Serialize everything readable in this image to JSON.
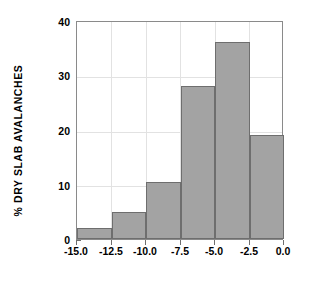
{
  "chart_data": {
    "type": "bar",
    "title": "",
    "subtitle": "",
    "xlabel": "",
    "ylabel": "% DRY SLAB AVALANCHES",
    "categories": [
      "-15.0 to -12.5",
      "-12.5 to -10.0",
      "-10.0 to -7.5",
      "-7.5 to -5.0",
      "-5.0 to -2.5",
      "-2.5 to 0.0"
    ],
    "bin_edges": [
      -15.0,
      -12.5,
      -10.0,
      -7.5,
      -5.0,
      -2.5,
      0.0
    ],
    "values": [
      2,
      5,
      10.5,
      28,
      36,
      19
    ],
    "xlim": [
      -15.0,
      0.0
    ],
    "ylim": [
      0,
      40
    ],
    "xticks": [
      -15.0,
      -12.5,
      -10.0,
      -7.5,
      -5.0,
      -2.5,
      0.0
    ],
    "yticks": [
      0,
      10,
      20,
      30,
      40
    ],
    "xtick_labels": [
      "-15.0",
      "-12.5",
      "-10.0",
      "-7.5",
      "-5.0",
      "-2.5",
      "0.0"
    ],
    "ytick_labels": [
      "0",
      "10",
      "20",
      "30",
      "40"
    ],
    "grid": true,
    "legend": null,
    "bar_color": "#a3a3a3",
    "bar_edge_color": "#6e6e6e",
    "grid_color": "#e2e2e2",
    "axis_color": "#8a8a8a",
    "background": "#ffffff"
  }
}
